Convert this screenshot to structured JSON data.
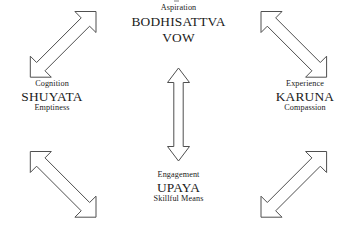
{
  "diagram": {
    "background_color": "#ffffff",
    "stroke_color": "#4f4f4f",
    "text_color": "#1a1a1a",
    "nodes": [
      {
        "id": "aspiration",
        "position": "top",
        "sub": "Aspiration",
        "main_line1": "BODHISATTVA",
        "main_line2": "VOW",
        "gloss": ""
      },
      {
        "id": "cognition",
        "position": "left",
        "sub": "Cognition",
        "main_line1": "SHUYATA",
        "main_line2": "",
        "gloss": "Emptiness"
      },
      {
        "id": "experience",
        "position": "right",
        "sub": "Experience",
        "main_line1": "KARUNA",
        "main_line2": "",
        "gloss": "Compassion"
      },
      {
        "id": "engagement",
        "position": "bottom",
        "sub": "Engagement",
        "main_line1": "UPAYA",
        "main_line2": "",
        "gloss": "Skillful Means"
      }
    ],
    "connectors": [
      {
        "id": "top-left",
        "name": "arrow-cognition-aspiration",
        "orientation": "diagonal-up-right",
        "style": "double-headed hollow",
        "connects": [
          "SHUYATA",
          "BODHISATTVA VOW"
        ]
      },
      {
        "id": "top-right",
        "name": "arrow-aspiration-experience",
        "orientation": "diagonal-down-right",
        "style": "double-headed hollow",
        "connects": [
          "BODHISATTVA VOW",
          "KARUNA"
        ]
      },
      {
        "id": "center-vertical",
        "name": "arrow-aspiration-engagement",
        "orientation": "vertical",
        "style": "double-headed hollow",
        "connects": [
          "BODHISATTVA VOW",
          "UPAYA"
        ]
      },
      {
        "id": "bottom-left",
        "name": "arrow-cognition-engagement",
        "orientation": "diagonal-down-right",
        "style": "double-headed hollow",
        "connects": [
          "SHUYATA",
          "UPAYA"
        ]
      },
      {
        "id": "bottom-right",
        "name": "arrow-engagement-experience",
        "orientation": "diagonal-up-right",
        "style": "double-headed hollow",
        "connects": [
          "UPAYA",
          "KARUNA"
        ]
      }
    ]
  }
}
